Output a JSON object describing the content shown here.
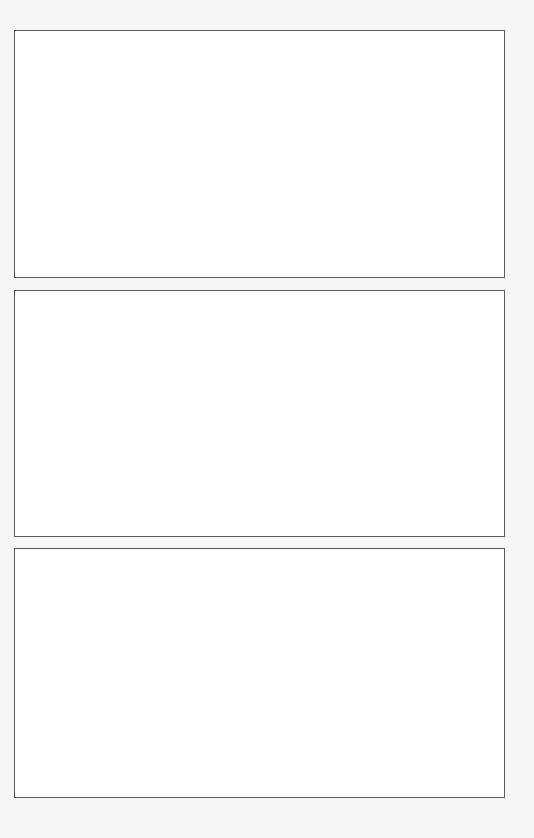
{
  "page": {
    "background_color": "#f7f7f7",
    "panel_border_color": "#5a5a5a",
    "panel_fill_color": "#ffffff"
  },
  "panels": [
    {
      "id": "panel-1",
      "content": ""
    },
    {
      "id": "panel-2",
      "content": ""
    },
    {
      "id": "panel-3",
      "content": ""
    }
  ]
}
